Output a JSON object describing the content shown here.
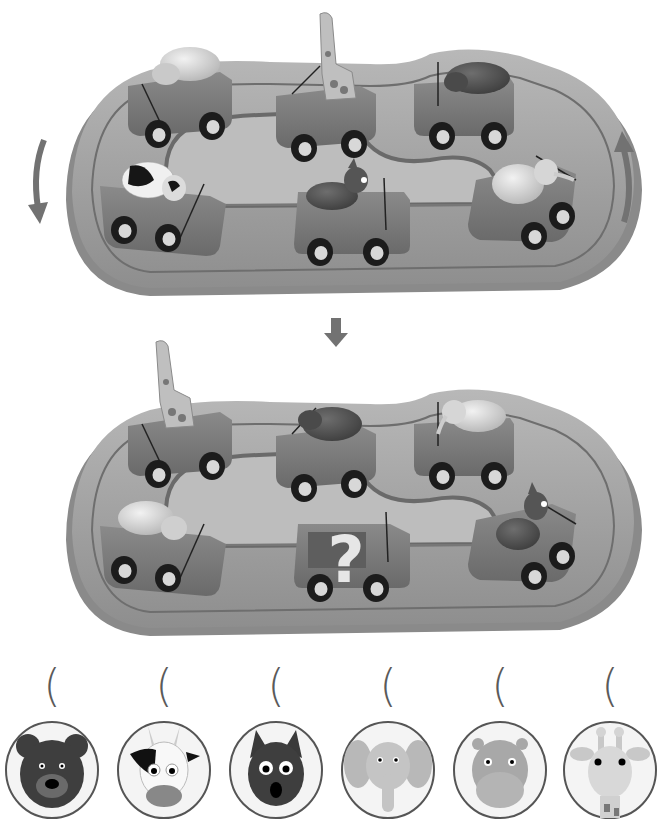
{
  "puzzle": {
    "description": "Animal carousel rotation puzzle: cars rotate along the track; identify which animal goes in the car marked with a question mark.",
    "colors": {
      "background": "#ffffff",
      "track_base": "#9a9a9a",
      "track_top": "#b4b4b4",
      "track_edge": "#7c7c7c",
      "car_body": "#7a7a7a",
      "wheel": "#1c1c1c",
      "arrow": "#727272",
      "question_mark": "#e6e6e6"
    },
    "rotation_arrows": {
      "left": "down-arrow-curved",
      "right": "up-arrow-curved",
      "between_scenes": "down-arrow"
    },
    "scene_before": {
      "cars": [
        {
          "position": "top-left",
          "animal": "hippo"
        },
        {
          "position": "top-middle",
          "animal": "giraffe"
        },
        {
          "position": "top-right",
          "animal": "rhino"
        },
        {
          "position": "bottom-left",
          "animal": "cow"
        },
        {
          "position": "bottom-middle",
          "animal": "wolf"
        },
        {
          "position": "bottom-right",
          "animal": "elephant"
        }
      ]
    },
    "scene_after": {
      "cars": [
        {
          "position": "top-left",
          "animal": "giraffe"
        },
        {
          "position": "top-middle",
          "animal": "rhino"
        },
        {
          "position": "top-right",
          "animal": "elephant"
        },
        {
          "position": "bottom-left",
          "animal": "hippo"
        },
        {
          "position": "bottom-middle",
          "animal": "?"
        },
        {
          "position": "bottom-right",
          "animal": "wolf"
        }
      ],
      "question_mark": "?"
    },
    "options": [
      {
        "animal": "bear",
        "answer_slot": "(    )"
      },
      {
        "animal": "cow",
        "answer_slot": "(    )"
      },
      {
        "animal": "wolf",
        "answer_slot": "(    )"
      },
      {
        "animal": "elephant",
        "answer_slot": "(    )"
      },
      {
        "animal": "hippo",
        "answer_slot": "(    )"
      },
      {
        "animal": "giraffe",
        "answer_slot": "(    )"
      }
    ]
  }
}
